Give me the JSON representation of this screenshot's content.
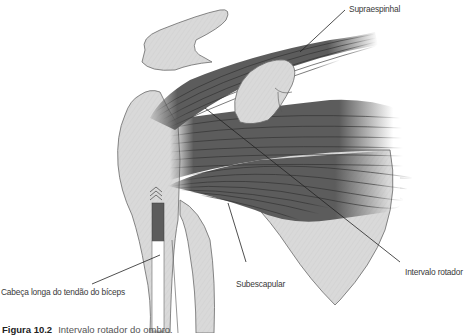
{
  "figure": {
    "type": "anatomical-illustration",
    "colors": {
      "bone": "#d9d9d9",
      "bone_outline": "#6a6a6a",
      "muscle": "#5c5c5c",
      "muscle_fiber": "#2e2e2e",
      "leader_line": "#222222",
      "label_text": "#3a3a3a"
    },
    "labels": {
      "supraespinhal": "Supraespinhal",
      "intervalo_rotador": "Intervalo rotador",
      "subescapular": "Subescapular",
      "biceps": "Cabeça longa do tendão do bíceps"
    },
    "caption": {
      "number": "Figura 10.2",
      "text": "Intervalo rotador do ombro."
    }
  }
}
